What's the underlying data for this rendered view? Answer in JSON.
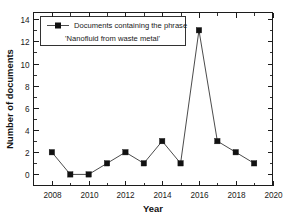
{
  "chart_data": {
    "type": "line",
    "title": "",
    "subtitle": "",
    "xlabel": "Year",
    "ylabel": "Number of documents",
    "xlim": [
      2007,
      2020
    ],
    "ylim": [
      -1,
      14.6
    ],
    "grid": false,
    "legend_position": "top-left",
    "x": [
      2008,
      2009,
      2010,
      2011,
      2012,
      2013,
      2014,
      2015,
      2016,
      2017,
      2018,
      2019
    ],
    "values": [
      2,
      0,
      0,
      1,
      2,
      1,
      3,
      1,
      13,
      3,
      2,
      1
    ],
    "series": [
      {
        "name": "Documents containing the phrase 'Nanofluid from waste metal'",
        "values": [
          2,
          0,
          0,
          1,
          2,
          1,
          3,
          1,
          13,
          3,
          2,
          1
        ],
        "marker": "filled-square",
        "color": "#111111"
      }
    ],
    "xticks": [
      2008,
      2010,
      2012,
      2014,
      2016,
      2018,
      2020
    ],
    "xticklabels": [
      "2008",
      "2010",
      "2012",
      "2014",
      "2016",
      "2018",
      "2020"
    ],
    "x_minor_ticks": [
      2009,
      2011,
      2013,
      2015,
      2017,
      2019
    ],
    "yticks": [
      0,
      2,
      4,
      6,
      8,
      10,
      12,
      14
    ],
    "yticklabels": [
      "0",
      "2",
      "4",
      "6",
      "8",
      "10",
      "12",
      "14"
    ],
    "y_minor_ticks": [
      1,
      3,
      5,
      7,
      9,
      11,
      13
    ],
    "annotations": []
  },
  "legend": {
    "line1": "Documents containing the phrase",
    "line2": "'Nanofluid from waste metal'",
    "marker_name": "filled-square-marker"
  },
  "axes": {
    "x_title": "Year",
    "y_title": "Number of documents"
  },
  "colors": {
    "line": "#2b2b2b",
    "marker": "#111111",
    "axis": "#1c1c1c",
    "background": "#ffffff",
    "text": "#1a1a1a"
  }
}
